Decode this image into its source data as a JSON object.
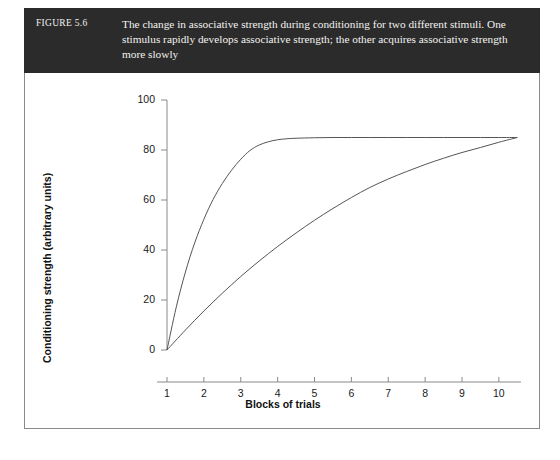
{
  "figure": {
    "number_label": "FIGURE 5.6",
    "caption": "The change in associative strength during conditioning for two different stimuli. One stimulus rapidly develops associative strength; the other acquires associative strength more slowly"
  },
  "colors": {
    "caption_bar_background": "#2b2b2b",
    "caption_text": "#f2f2f0",
    "page_background": "#ffffff",
    "frame_border": "#8a8a8a",
    "axis_line": "#8a8a8a",
    "curve_stroke": "#555555"
  },
  "chart_data": {
    "type": "line",
    "title": "",
    "xlabel": "Blocks of trials",
    "ylabel": "Conditioning strength (arbitrary units)",
    "xlim": [
      1,
      10.6
    ],
    "ylim": [
      0,
      100
    ],
    "xticks": [
      1,
      2,
      3,
      4,
      5,
      6,
      7,
      8,
      9,
      10
    ],
    "xtick_labels": [
      "1",
      "2",
      "3",
      "4",
      "5",
      "6",
      "7",
      "8",
      "9",
      "10"
    ],
    "yticks": [
      0,
      20,
      40,
      60,
      80,
      100
    ],
    "ytick_labels": [
      "0",
      "20",
      "40",
      "60",
      "80",
      "100"
    ],
    "grid": false,
    "legend": null,
    "asymptote": 85,
    "series": [
      {
        "name": "Rapidly acquired stimulus",
        "x": [
          1,
          1.25,
          1.5,
          1.75,
          2,
          2.25,
          2.5,
          2.75,
          3,
          3.25,
          3.5,
          3.75,
          4,
          4.25,
          4.5,
          5,
          5.5,
          6,
          6.5,
          7,
          7.5,
          8,
          8.5,
          9,
          9.5,
          10,
          10.5
        ],
        "y": [
          0,
          17.1,
          31.2,
          42.8,
          52.3,
          60.2,
          66.6,
          71.9,
          76.3,
          79.8,
          82.0,
          83.3,
          84.1,
          84.5,
          84.7,
          84.9,
          85.0,
          85.0,
          85.0,
          85.0,
          85.0,
          85.0,
          85.0,
          85.0,
          85.0,
          85.0,
          85.0
        ]
      },
      {
        "name": "Slowly acquired stimulus",
        "x": [
          1,
          1.5,
          2,
          2.5,
          3,
          3.5,
          4,
          4.5,
          5,
          5.5,
          6,
          6.5,
          7,
          7.5,
          8,
          8.5,
          9,
          9.5,
          10,
          10.5
        ],
        "y": [
          0,
          8.0,
          15.6,
          22.7,
          29.4,
          35.6,
          41.4,
          46.8,
          51.9,
          56.6,
          61.0,
          65.0,
          68.4,
          71.4,
          74.2,
          76.7,
          79.0,
          81.0,
          83.1,
          85.0
        ]
      }
    ]
  }
}
